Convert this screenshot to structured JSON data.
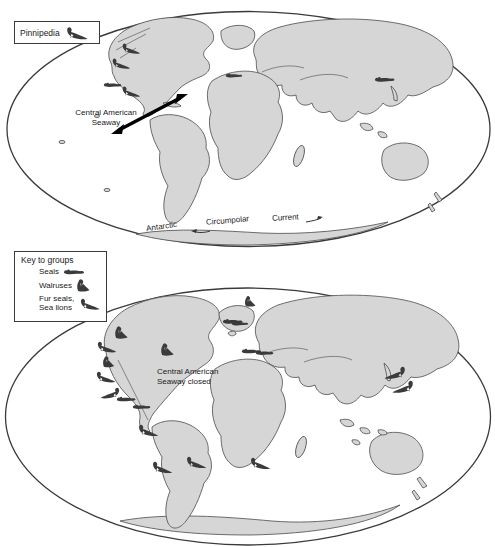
{
  "figure": {
    "pinnipedia_label": "Pinnipedia",
    "map1": {
      "seaway_label_line1": "Central American",
      "seaway_label_line2": "Seaway",
      "current_word1": "Antarctic",
      "current_word2": "Circumpolar",
      "current_word3": "Current",
      "icons": [
        {
          "type": "furseal",
          "x": 120,
          "y": 42,
          "s": 0.85
        },
        {
          "type": "furseal",
          "x": 110,
          "y": 57,
          "s": 0.85
        },
        {
          "type": "seal",
          "x": 103,
          "y": 80,
          "s": 0.8
        },
        {
          "type": "furseal",
          "x": 120,
          "y": 85,
          "s": 0.85
        },
        {
          "type": "seal",
          "x": 225,
          "y": 71,
          "s": 0.75
        },
        {
          "type": "seal",
          "x": 374,
          "y": 74,
          "s": 0.9
        }
      ]
    },
    "map2": {
      "seaway_label_line1": "Central American",
      "seaway_label_line2": "Seaway closed",
      "icons": [
        {
          "type": "walrus",
          "x": 114,
          "y": 325,
          "s": 0.95
        },
        {
          "type": "furseal",
          "x": 95,
          "y": 340,
          "s": 0.9
        },
        {
          "type": "walrus",
          "x": 102,
          "y": 355,
          "s": 0.85
        },
        {
          "type": "furseal",
          "x": 94,
          "y": 370,
          "s": 0.9
        },
        {
          "type": "furseal",
          "x": 122,
          "y": 386,
          "s": 0.9,
          "flip": true
        },
        {
          "type": "seal",
          "x": 116,
          "y": 394,
          "s": 0.85
        },
        {
          "type": "seal",
          "x": 132,
          "y": 402,
          "s": 0.8
        },
        {
          "type": "walrus",
          "x": 160,
          "y": 342,
          "s": 0.95
        },
        {
          "type": "seal",
          "x": 222,
          "y": 316,
          "s": 0.9
        },
        {
          "type": "walrus",
          "x": 244,
          "y": 295,
          "s": 0.8
        },
        {
          "type": "seal",
          "x": 231,
          "y": 319,
          "s": 0.75
        },
        {
          "type": "seal",
          "x": 241,
          "y": 346,
          "s": 0.85
        },
        {
          "type": "seal",
          "x": 255,
          "y": 348,
          "s": 0.8
        },
        {
          "type": "furseal",
          "x": 408,
          "y": 365,
          "s": 1,
          "flip": true
        },
        {
          "type": "furseal",
          "x": 416,
          "y": 379,
          "s": 1,
          "flip": true
        },
        {
          "type": "furseal",
          "x": 136,
          "y": 423,
          "s": 0.95
        },
        {
          "type": "furseal",
          "x": 150,
          "y": 460,
          "s": 0.95
        },
        {
          "type": "furseal",
          "x": 184,
          "y": 455,
          "s": 0.95
        },
        {
          "type": "furseal",
          "x": 248,
          "y": 456,
          "s": 0.95
        }
      ]
    },
    "legend": {
      "title": "Key to groups",
      "items": [
        {
          "label": "Seals",
          "icon": "seal-icon"
        },
        {
          "label": "Walruses",
          "icon": "walrus-icon"
        },
        {
          "label": "Fur seals,",
          "label2": "Sea lions",
          "icon": "fur-seal-icon"
        }
      ]
    },
    "colors": {
      "land": "#d6d6d6",
      "outline": "#4a4a4a",
      "icon": "#3b3b3b",
      "text": "#1a1a1a",
      "background": "#ffffff"
    }
  }
}
